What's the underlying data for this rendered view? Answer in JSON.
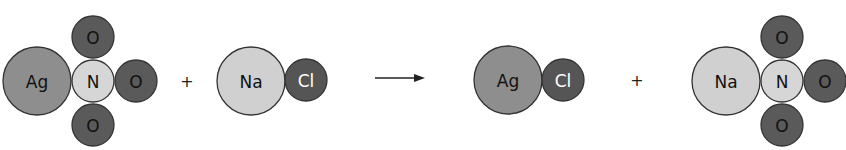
{
  "colors": {
    "Ag": "#8e8e8e",
    "N": "#d6d6d6",
    "O": "#5a5a5a",
    "Na": "#d0d0d0",
    "Cl": "#555555",
    "stroke": "#333333",
    "label_dark": "#111111",
    "label_light": "#ffffff"
  },
  "equation": {
    "reactants": [
      {
        "formula": "AgNO3",
        "atoms": [
          {
            "label": "Ag",
            "cx": 37,
            "cy": 81,
            "r": 34
          },
          {
            "label": "N",
            "cx": 93,
            "cy": 81,
            "r": 21
          },
          {
            "label": "O",
            "cx": 93,
            "cy": 37,
            "r": 21
          },
          {
            "label": "O",
            "cx": 136,
            "cy": 81,
            "r": 21
          },
          {
            "label": "O",
            "cx": 93,
            "cy": 125,
            "r": 21
          }
        ]
      },
      {
        "formula": "NaCl",
        "atoms": [
          {
            "label": "Na",
            "cx": 251,
            "cy": 81,
            "r": 34
          },
          {
            "label": "Cl",
            "cx": 306,
            "cy": 80,
            "r": 21
          }
        ]
      }
    ],
    "products": [
      {
        "formula": "AgCl",
        "atoms": [
          {
            "label": "Ag",
            "cx": 508,
            "cy": 80,
            "r": 34
          },
          {
            "label": "Cl",
            "cx": 563,
            "cy": 80,
            "r": 21
          }
        ]
      },
      {
        "formula": "NaNO3",
        "atoms": [
          {
            "label": "Na",
            "cx": 726,
            "cy": 81,
            "r": 34
          },
          {
            "label": "N",
            "cx": 782,
            "cy": 81,
            "r": 21
          },
          {
            "label": "O",
            "cx": 782,
            "cy": 37,
            "r": 21
          },
          {
            "label": "O",
            "cx": 825,
            "cy": 81,
            "r": 21
          },
          {
            "label": "O",
            "cx": 782,
            "cy": 125,
            "r": 21
          }
        ]
      }
    ],
    "operators": {
      "plus_left": "+",
      "plus_right": "+",
      "arrow": "→"
    }
  }
}
